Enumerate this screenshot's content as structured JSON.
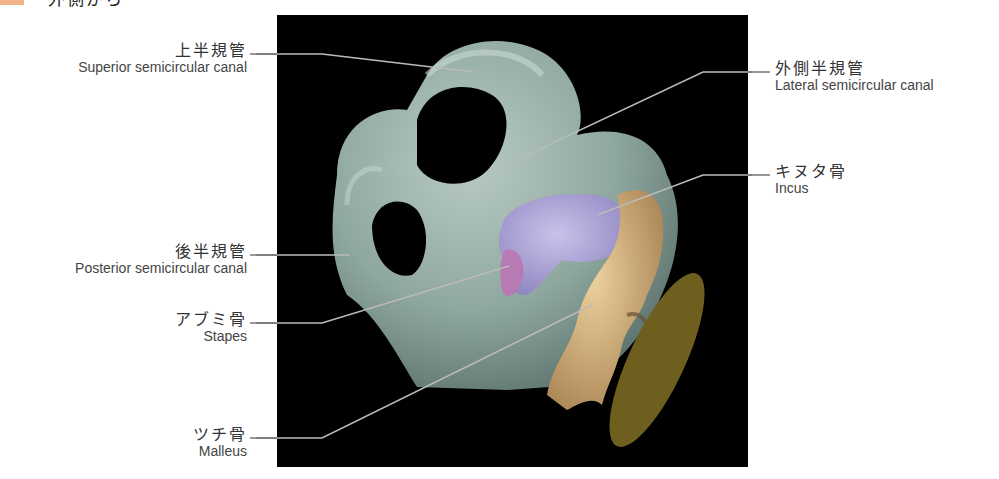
{
  "header": {
    "title": "外側から",
    "badge_color": "#f4b48a"
  },
  "figure": {
    "background": "#000000",
    "colors": {
      "semicircular_canals": "#8fa89f",
      "incus": "#a59ccf",
      "stapes": "#b77ab3",
      "malleus": "#d9b57f",
      "tympanic_membrane": "#6e5f1e"
    }
  },
  "labels": {
    "superior": {
      "jp": "上半規管",
      "en": "Superior semicircular canal"
    },
    "lateral": {
      "jp": "外側半規管",
      "en": "Lateral semicircular canal"
    },
    "incus": {
      "jp": "キヌタ骨",
      "en": "Incus"
    },
    "posterior": {
      "jp": "後半規管",
      "en": "Posterior semicircular canal"
    },
    "stapes": {
      "jp": "アブミ骨",
      "en": "Stapes"
    },
    "malleus": {
      "jp": "ツチ骨",
      "en": "Malleus"
    }
  }
}
